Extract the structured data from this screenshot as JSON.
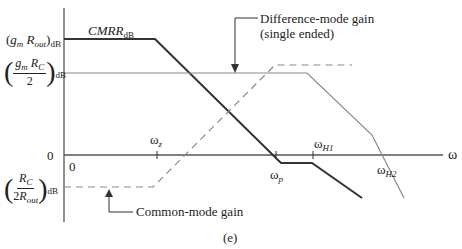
{
  "figure": {
    "caption": "(e)",
    "y_axis_labels": {
      "gm_rout": {
        "open": "(",
        "g": "g",
        "g_sub": "m",
        "r": "R",
        "r_sub": "out",
        "close": ")",
        "unit": "dB"
      },
      "gm_rc_half": {
        "num_g": "g",
        "num_g_sub": "m",
        "num_r": "R",
        "num_r_sub": "C",
        "den": "2",
        "unit": "dB"
      },
      "zero": "0",
      "rc_2rout": {
        "num_r": "R",
        "num_r_sub": "C",
        "den_pre": "2",
        "den_r": "R",
        "den_r_sub": "out",
        "unit": "dB"
      }
    },
    "origin_label": "0",
    "x_axis_label": "ω",
    "ticks": {
      "wz": {
        "base": "ω",
        "sub": "z"
      },
      "wp": {
        "base": "ω",
        "sub": "p"
      },
      "wh1": {
        "base": "ω",
        "sub": "H1"
      },
      "wh2": {
        "base": "ω",
        "sub": "H2"
      }
    },
    "curves": {
      "cmrr": {
        "base": "CMRR",
        "sub": "dB"
      },
      "difference_mode": {
        "line1": "Difference-mode gain",
        "line2": "(single ended)"
      },
      "common_mode": {
        "label": "Common-mode gain"
      }
    },
    "colors": {
      "axis": "#555555",
      "cmrr": "#333333",
      "diff": "#888888",
      "common": "#888888"
    }
  }
}
